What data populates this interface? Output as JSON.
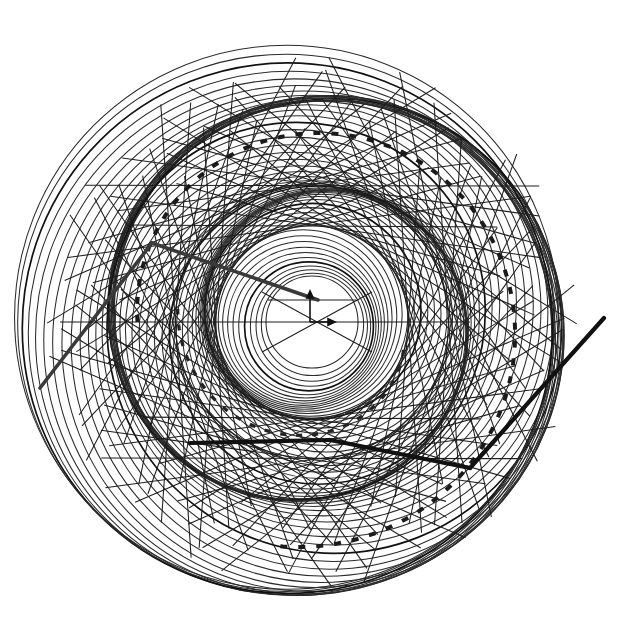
{
  "figure": {
    "background_color": "#ffffff",
    "stroke_color": "#1e1e1e",
    "accent_color": "#111111",
    "width": 618,
    "height": 643
  },
  "center_marker": {
    "name": "origin-vector-pair",
    "cx": 310,
    "cy": 322,
    "up_arrow_length": 28,
    "right_arrow_length": 22,
    "baseline_left_x": 60,
    "baseline_right_x": 470
  },
  "core": {
    "label": "central-clear-disk",
    "cx": 312,
    "cy": 322,
    "r": 44
  },
  "chart_data": {
    "type": "scatter",
    "subtitle": "",
    "xlabel": "",
    "ylabel": "",
    "xlim": [
      0,
      618
    ],
    "ylim": [
      0,
      643
    ],
    "grid": false,
    "legend": "none",
    "annotations": [
      "origin vector pair at centre",
      "thick dashed spiral arc",
      "thick straight chord segments"
    ],
    "series": [
      {
        "name": "spiral-rings",
        "kind": "circles",
        "count": 62,
        "cx_start": 312,
        "cy_start": 322,
        "r_start": 46,
        "r_end": 272,
        "center_drift_radius": 26,
        "center_drift_turns": 2.35,
        "stroke_width": 1.05
      },
      {
        "name": "lattice-chords",
        "kind": "lines",
        "count": 46,
        "description": "straight chords tangent to an inner circle, forming X crossings",
        "inner_tangent_radius": 96,
        "outer_extent": 288
      },
      {
        "name": "dashed-spiral-arc",
        "kind": "dashed-arc",
        "dash_on": 7,
        "dash_off": 11,
        "stroke_width": 4.0
      },
      {
        "name": "thick-chords",
        "kind": "lines",
        "count": 5,
        "stroke_width": 4.2,
        "endpoints": [
          [
            40,
            388,
            152,
            243
          ],
          [
            152,
            243,
            318,
            300
          ],
          [
            190,
            443,
            330,
            440
          ],
          [
            330,
            440,
            470,
            468
          ],
          [
            470,
            468,
            604,
            318
          ]
        ]
      }
    ]
  }
}
